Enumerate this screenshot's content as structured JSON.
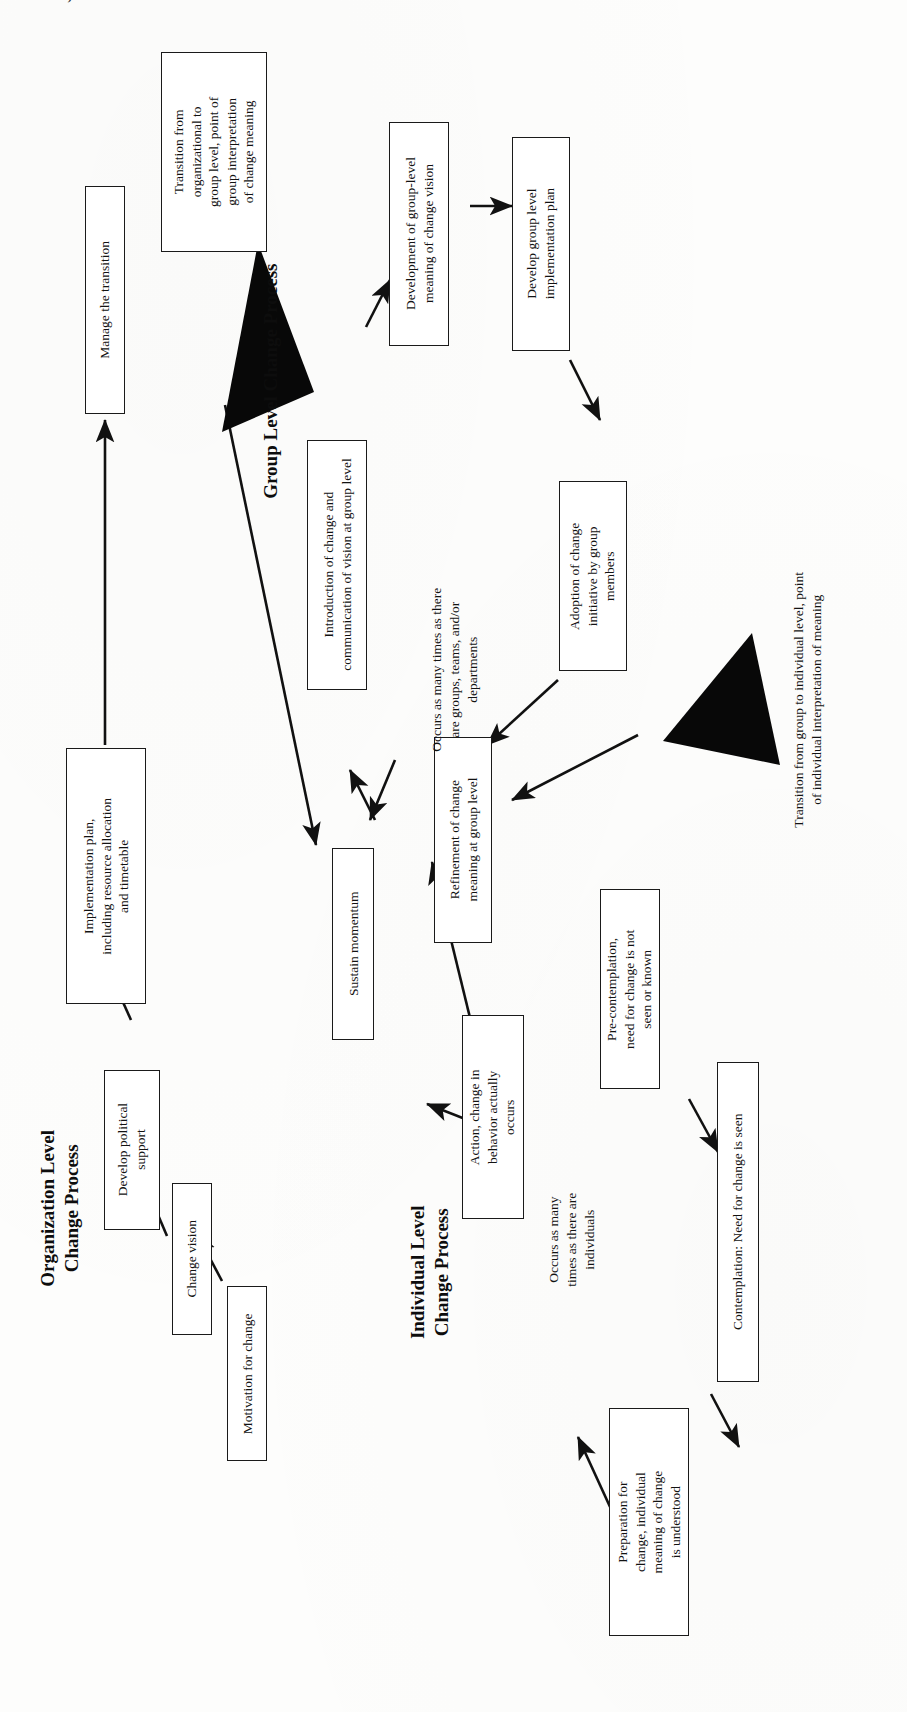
{
  "page": {
    "top_cut_text": "MODEL, ILLUSTRATING CHANGE AT ALL LEVELS OF AN ORGANIZATION",
    "orientation": "rotated-90-ccw",
    "ink_color": "#121212",
    "paper_color": "#fdfdfc"
  },
  "headings": {
    "organization": "Organization Level\nChange Process",
    "group": "Group Level Change Process",
    "individual": "Individual Level\nChange Process"
  },
  "organization_level": {
    "nodes": [
      {
        "id": "motivation",
        "label": "Motivation for change"
      },
      {
        "id": "change-vision",
        "label": "Change vision"
      },
      {
        "id": "political",
        "label": "Develop political\nsupport"
      },
      {
        "id": "implementation",
        "label": "Implementation plan,\nincluding resource allocation\nand timetable"
      },
      {
        "id": "manage",
        "label": "Manage the transition"
      },
      {
        "id": "sustain",
        "label": "Sustain momentum"
      }
    ]
  },
  "group_level": {
    "nodes": [
      {
        "id": "introduction",
        "label": "Introduction of change and\ncommunication of vision at group level"
      },
      {
        "id": "dev-meaning",
        "label": "Development of group-level\nmeaning of change vision"
      },
      {
        "id": "dev-plan",
        "label": "Develop group level\nimplementation plan"
      },
      {
        "id": "adoption",
        "label": "Adoption of change\ninitiative by group\nmembers"
      },
      {
        "id": "refinement",
        "label": "Refinement of  change\nmeaning at group level"
      }
    ],
    "note": "Occurs as many times as there\nare groups, teams, and/or\ndepartments"
  },
  "individual_level": {
    "nodes": [
      {
        "id": "precontemplation",
        "label": "Pre-contemplation,\nneed for change is not\nseen or known"
      },
      {
        "id": "contemplation",
        "label": "Contemplation: Need for change is seen"
      },
      {
        "id": "preparation",
        "label": "Preparation for\nchange, individual\nmeaning of change\nis understood"
      },
      {
        "id": "action",
        "label": "Action, change in\nbehavior actually\noccurs"
      }
    ],
    "note": "Occurs as many\ntimes as there are\nindividuals"
  },
  "transitions": [
    {
      "id": "org-to-group",
      "label": "Transition from\norganizational to\ngroup level, point of\ngroup interpretation\nof change meaning",
      "boxed": true
    },
    {
      "id": "group-to-individual",
      "label": "Transition from group to individual level, point\nof individual interpretation of meaning",
      "boxed": false
    }
  ],
  "markers": {
    "triangle_org_to_group": "solid-black-triangle",
    "triangle_group_to_individual": "solid-black-triangle"
  }
}
